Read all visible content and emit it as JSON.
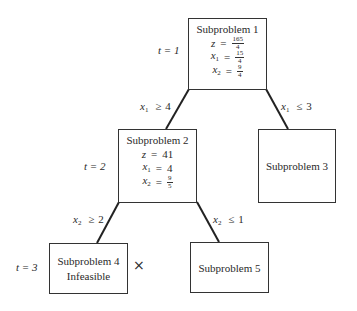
{
  "diagram": {
    "type": "branch-and-bound-tree",
    "nodes": [
      {
        "id": "sp1",
        "title": "Subproblem 1",
        "z_label": "z",
        "z_num": "165",
        "z_den": "4",
        "x1_label": "x",
        "x1_sub": "1",
        "x1_num": "15",
        "x1_den": "4",
        "x2_label": "x",
        "x2_sub": "2",
        "x2_num": "9",
        "x2_den": "4",
        "step_label": "t = 1"
      },
      {
        "id": "sp2",
        "title": "Subproblem 2",
        "z_label": "z",
        "z_value": "41",
        "x1_label": "x",
        "x1_sub": "1",
        "x1_value": "4",
        "x2_label": "x",
        "x2_sub": "2",
        "x2_num": "9",
        "x2_den": "5",
        "step_label": "t = 2"
      },
      {
        "id": "sp3",
        "title": "Subproblem 3"
      },
      {
        "id": "sp4",
        "title": "Subproblem 4",
        "status": "Infeasible",
        "step_label": "t = 3",
        "pruned_mark": "×"
      },
      {
        "id": "sp5",
        "title": "Subproblem 5"
      }
    ],
    "edges": [
      {
        "from": "sp1",
        "to": "sp2",
        "var": "x",
        "sub": "1",
        "op": "≥",
        "value": "4"
      },
      {
        "from": "sp1",
        "to": "sp3",
        "var": "x",
        "sub": "1",
        "op": "≤",
        "value": "3"
      },
      {
        "from": "sp2",
        "to": "sp4",
        "var": "x",
        "sub": "2",
        "op": "≥",
        "value": "2"
      },
      {
        "from": "sp2",
        "to": "sp5",
        "var": "x",
        "sub": "2",
        "op": "≤",
        "value": "1"
      }
    ],
    "eq_sign": "="
  }
}
